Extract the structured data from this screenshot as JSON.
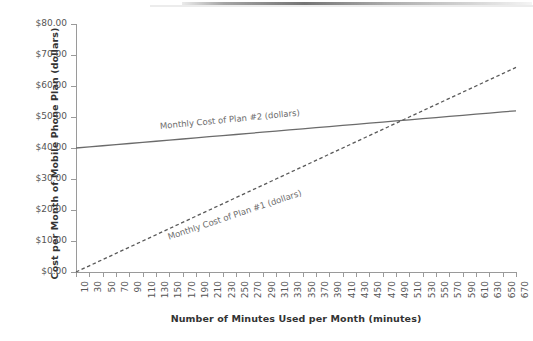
{
  "chart_data": {
    "type": "line",
    "title": "",
    "xlabel": "Number of Minutes Used per Month (minutes)",
    "ylabel": "Cost per Month of Mobile Phone Plan (dollars)",
    "xlim": [
      10,
      670
    ],
    "ylim": [
      0,
      80
    ],
    "grid": false,
    "legend_position": "inline-on-line",
    "x_tick_labels": [
      "10",
      "30",
      "50",
      "70",
      "90",
      "110",
      "130",
      "150",
      "170",
      "190",
      "210",
      "230",
      "250",
      "270",
      "290",
      "310",
      "330",
      "350",
      "370",
      "390",
      "410",
      "430",
      "450",
      "470",
      "490",
      "510",
      "530",
      "550",
      "570",
      "590",
      "610",
      "630",
      "650",
      "670"
    ],
    "y_tick_labels": [
      "$0.00",
      "$10.00",
      "$20.00",
      "$30.00",
      "$40.00",
      "$50.00",
      "$60.00",
      "$70.00",
      "$80.00"
    ],
    "y_tick_values": [
      0,
      10,
      20,
      30,
      40,
      50,
      60,
      70,
      80
    ],
    "x": [
      10,
      30,
      50,
      70,
      90,
      110,
      130,
      150,
      170,
      190,
      210,
      230,
      250,
      270,
      290,
      310,
      330,
      350,
      370,
      390,
      410,
      430,
      450,
      470,
      490,
      510,
      530,
      550,
      570,
      590,
      610,
      630,
      650,
      670
    ],
    "series": [
      {
        "name": "Monthly Cost of Plan #1 (dollars)",
        "style": "dashed",
        "color": "#595959",
        "values": [
          0.0,
          2.0,
          4.0,
          6.0,
          8.0,
          10.0,
          12.0,
          14.0,
          16.0,
          18.0,
          20.0,
          22.0,
          24.0,
          26.0,
          28.0,
          30.0,
          32.0,
          34.0,
          36.0,
          38.0,
          40.0,
          42.0,
          44.0,
          46.0,
          48.0,
          50.0,
          52.0,
          54.0,
          56.0,
          58.0,
          60.0,
          62.0,
          64.0,
          66.0
        ]
      },
      {
        "name": "Monthly Cost of Plan #2 (dollars)",
        "style": "solid",
        "color": "#6b6b6b",
        "values": [
          40.0,
          40.36,
          40.73,
          41.09,
          41.45,
          41.82,
          42.18,
          42.55,
          42.91,
          43.27,
          43.64,
          44.0,
          44.36,
          44.73,
          45.09,
          45.45,
          45.82,
          46.18,
          46.55,
          46.91,
          47.27,
          47.64,
          48.0,
          48.36,
          48.73,
          49.09,
          49.45,
          49.82,
          50.18,
          50.55,
          50.91,
          51.27,
          51.64,
          52.0
        ]
      }
    ],
    "intersection": {
      "x": 490,
      "y": 48.7
    },
    "annotations": [
      {
        "text": "Monthly Cost of Plan #2 (dollars)",
        "series": "Monthly Cost of Plan #2 (dollars)"
      },
      {
        "text": "Monthly Cost of Plan #1 (dollars)",
        "series": "Monthly Cost of Plan #1 (dollars)"
      }
    ]
  },
  "colors": {
    "axis": "#9a9a9a",
    "tick_text": "#555555",
    "title_text": "#333333",
    "annotation_text": "#6d6d6d",
    "background": "#ffffff"
  }
}
